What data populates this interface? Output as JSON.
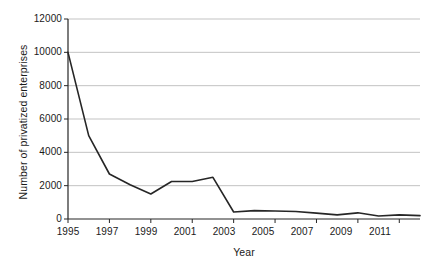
{
  "chart_data": {
    "type": "line",
    "title": "",
    "xlabel": "Year",
    "ylabel": "Number of privatized enterprises",
    "xlim": [
      1995,
      2012
    ],
    "ylim": [
      0,
      12000
    ],
    "grid": true,
    "legend": null,
    "x_tick_labels": [
      "1995",
      "1997",
      "1999",
      "2001",
      "2003",
      "2005",
      "2007",
      "2009",
      "2011"
    ],
    "x_tick_values": [
      1995,
      1997,
      1999,
      2001,
      2003,
      2005,
      2007,
      2009,
      2011
    ],
    "y_tick_labels": [
      "0",
      "2000",
      "4000",
      "6000",
      "8000",
      "10000",
      "12000"
    ],
    "y_tick_values": [
      0,
      2000,
      4000,
      6000,
      8000,
      10000,
      12000
    ],
    "x": [
      1995,
      1996,
      1997,
      1998,
      1999,
      2000,
      2001,
      2002,
      2003,
      2004,
      2005,
      2006,
      2007,
      2008,
      2009,
      2010,
      2011,
      2012
    ],
    "values": [
      10000,
      5000,
      2700,
      2050,
      1500,
      2250,
      2250,
      2500,
      420,
      500,
      480,
      450,
      350,
      250,
      370,
      180,
      250,
      200
    ],
    "series": [
      {
        "name": "Number of privatized enterprises",
        "color": "#262626",
        "values": [
          10000,
          5000,
          2700,
          2050,
          1500,
          2250,
          2250,
          2500,
          420,
          500,
          480,
          450,
          350,
          250,
          370,
          180,
          250,
          200
        ]
      }
    ],
    "colors": {
      "line": "#262626",
      "grid": "#b4b4b4",
      "axis": "#262626",
      "background": "#ffffff"
    }
  }
}
